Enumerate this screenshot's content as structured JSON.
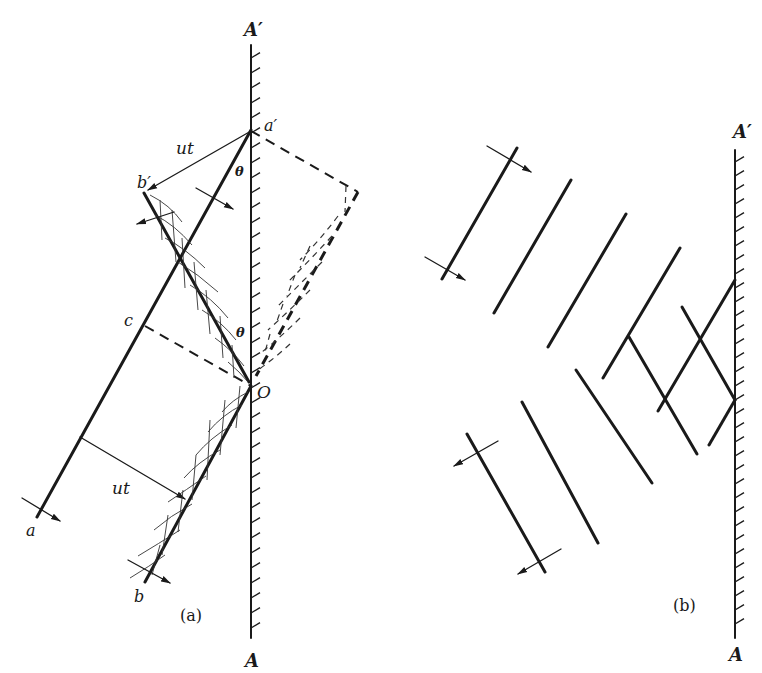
{
  "figure": {
    "panel_a": {
      "caption": "(a)",
      "labels": {
        "mirror_top": "A′",
        "mirror_bottom": "A",
        "point_a_prime": "a′",
        "point_b_prime": "b′",
        "point_c": "c",
        "point_o": "O",
        "point_a": "a",
        "point_b": "b",
        "ut_upper": "ut",
        "ut_lower": "ut",
        "theta_upper": "θ",
        "theta_lower": "θ"
      }
    },
    "panel_b": {
      "caption": "(b)",
      "labels": {
        "mirror_top": "A′",
        "mirror_bottom": "A"
      }
    }
  }
}
